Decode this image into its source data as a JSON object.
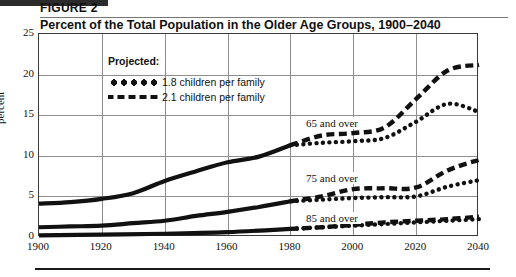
{
  "figure": {
    "label": "FIGURE  2",
    "title": "Percent of the Total Population in the Older Age Groups, 1900–2040"
  },
  "legend": {
    "title": "Projected:",
    "items": [
      {
        "label": "1.8 children per family",
        "style": "dotted",
        "key": "dotted-line-key"
      },
      {
        "label": "2.1 children per family",
        "style": "dashed",
        "key": "dashed-line-key"
      }
    ]
  },
  "annotations": [
    {
      "text": "65 and over",
      "x": 303,
      "y": 117
    },
    {
      "text": "75 and over",
      "x": 303,
      "y": 172
    },
    {
      "text": "85 and over",
      "x": 303,
      "y": 212
    }
  ],
  "chart_data": {
    "type": "line",
    "title": "Percent of the Total Population in the Older Age Groups, 1900–2040",
    "xlabel": "",
    "ylabel": "percent",
    "xlim": [
      1900,
      2040
    ],
    "ylim": [
      0,
      25
    ],
    "xticks": [
      1900,
      1920,
      1940,
      1960,
      1980,
      2000,
      2020,
      2040
    ],
    "yticks": [
      0,
      5,
      10,
      15,
      20,
      25
    ],
    "grid": true,
    "legend_position": "upper-left-inside",
    "projection_start_year": 1980,
    "series": [
      {
        "name": "65 and over (historical)",
        "group": "65 and over",
        "style": "solid",
        "x": [
          1900,
          1910,
          1920,
          1930,
          1940,
          1950,
          1960,
          1970,
          1980
        ],
        "values": [
          4.1,
          4.3,
          4.7,
          5.4,
          6.9,
          8.1,
          9.2,
          9.9,
          11.3
        ]
      },
      {
        "name": "65 and over — 2.1 children per family",
        "group": "65 and over",
        "style": "dashed",
        "x": [
          1980,
          1990,
          2000,
          2010,
          2020,
          2030,
          2040
        ],
        "values": [
          11.3,
          12.5,
          12.8,
          13.5,
          17.0,
          20.5,
          21.2
        ]
      },
      {
        "name": "65 and over — 1.8 children per family",
        "group": "65 and over",
        "style": "dotted",
        "x": [
          1980,
          1990,
          2000,
          2010,
          2020,
          2030,
          2040
        ],
        "values": [
          11.3,
          11.6,
          11.8,
          12.2,
          14.2,
          16.4,
          15.4
        ]
      },
      {
        "name": "75 and over (historical)",
        "group": "75 and over",
        "style": "solid",
        "x": [
          1900,
          1910,
          1920,
          1930,
          1940,
          1950,
          1960,
          1970,
          1980
        ],
        "values": [
          1.2,
          1.3,
          1.4,
          1.7,
          2.0,
          2.6,
          3.1,
          3.7,
          4.4
        ]
      },
      {
        "name": "75 and over — 2.1 children per family",
        "group": "75 and over",
        "style": "dashed",
        "x": [
          1980,
          1990,
          2000,
          2010,
          2020,
          2030,
          2040
        ],
        "values": [
          4.4,
          5.0,
          5.9,
          6.0,
          6.1,
          8.2,
          9.5
        ]
      },
      {
        "name": "75 and over — 1.8 children per family",
        "group": "75 and over",
        "style": "dotted",
        "x": [
          1980,
          1990,
          2000,
          2010,
          2020,
          2030,
          2040
        ],
        "values": [
          4.4,
          4.6,
          4.8,
          4.9,
          5.0,
          6.2,
          7.0
        ]
      },
      {
        "name": "85 and over (historical)",
        "group": "85 and over",
        "style": "solid",
        "x": [
          1900,
          1920,
          1940,
          1960,
          1980
        ],
        "values": [
          0.2,
          0.3,
          0.4,
          0.6,
          1.0
        ]
      },
      {
        "name": "85 and over — 2.1 children per family",
        "group": "85 and over",
        "style": "dashed",
        "x": [
          1980,
          1990,
          2000,
          2010,
          2020,
          2030,
          2040
        ],
        "values": [
          1.0,
          1.2,
          1.5,
          1.8,
          2.0,
          2.2,
          2.5
        ]
      },
      {
        "name": "85 and over — 1.8 children per family",
        "group": "85 and over",
        "style": "dotted",
        "x": [
          1980,
          1990,
          2000,
          2010,
          2020,
          2030,
          2040
        ],
        "values": [
          1.0,
          1.2,
          1.4,
          1.6,
          1.8,
          2.0,
          2.2
        ]
      }
    ]
  }
}
